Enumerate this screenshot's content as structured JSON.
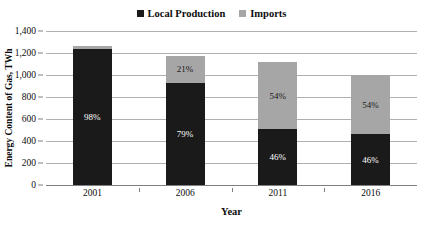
{
  "chart_data": {
    "type": "bar",
    "subtype": "stacked-bar",
    "title": "",
    "xlabel": "Year",
    "ylabel": "Energy Content of Gas, TWh",
    "categories": [
      "2001",
      "2006",
      "2011",
      "2016"
    ],
    "ylim": [
      0,
      1400
    ],
    "yticks": [
      0,
      200,
      400,
      600,
      800,
      1000,
      1200,
      1400
    ],
    "ytick_labels": [
      "0",
      "200",
      "400",
      "600",
      "800",
      "1,000",
      "1,200",
      "1,400"
    ],
    "grid": true,
    "legend_position": "top-center",
    "series": [
      {
        "name": "Local Production",
        "color": "#1a1a1a",
        "values": [
          1235,
          930,
          510,
          460
        ],
        "labels": [
          "98%",
          "79%",
          "46%",
          "46%"
        ],
        "label_color": "#ffffff"
      },
      {
        "name": "Imports",
        "color": "#a6a6a6",
        "values": [
          25,
          245,
          605,
          540
        ],
        "labels": [
          "",
          "21%",
          "54%",
          "54%"
        ],
        "label_color": "#1a1a1a"
      }
    ],
    "totals": [
      1260,
      1175,
      1115,
      1000
    ]
  }
}
